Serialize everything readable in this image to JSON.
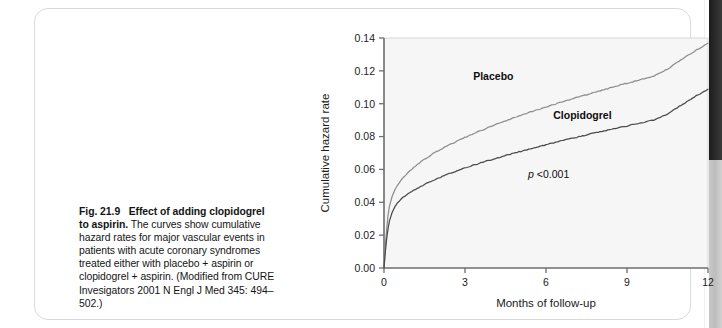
{
  "figure": {
    "caption": {
      "label": "Fig. 21.9",
      "title": "Effect of adding clopidogrel to aspirin.",
      "body": " The curves show cumulative hazard rates for major vascular events in patients with acute coronary syndromes treated either with placebo + aspirin or clopidogrel + aspirin. (Modified from CURE Invesigators 2001 N Engl J Med 345: 494–502.)"
    }
  },
  "chart_data": {
    "type": "line",
    "title": "",
    "xlabel": "Months of follow-up",
    "ylabel": "Cumulative hazard rate",
    "xlim": [
      0,
      12
    ],
    "ylim": [
      0.0,
      0.14
    ],
    "xticks": [
      0,
      3,
      6,
      9,
      12
    ],
    "xtick_labels": [
      "0",
      "3",
      "6",
      "9",
      "12"
    ],
    "yticks": [
      0.0,
      0.02,
      0.04,
      0.06,
      0.08,
      0.1,
      0.12,
      0.14
    ],
    "ytick_labels": [
      "0.00",
      "0.02",
      "0.04",
      "0.06",
      "0.08",
      "0.10",
      "0.12",
      "0.14"
    ],
    "grid": false,
    "legend_position": "inline-annotations",
    "annotations": [
      {
        "name": "p-value",
        "text_italic": "p",
        "text": " <0.001",
        "x": 6.1,
        "y": 0.055
      }
    ],
    "series": [
      {
        "name": "Placebo",
        "color": "#8d8d8d",
        "label_x": 4.05,
        "label_y": 0.1145,
        "x": [
          0,
          0.05,
          0.1,
          0.15,
          0.2,
          0.3,
          0.4,
          0.5,
          0.7,
          0.9,
          1.1,
          1.3,
          1.5,
          1.8,
          2.1,
          2.4,
          2.7,
          3.0,
          3.4,
          3.8,
          4.2,
          4.6,
          5.0,
          5.5,
          6.0,
          6.5,
          7.0,
          7.5,
          8.0,
          8.5,
          9.0,
          9.5,
          10.0,
          10.5,
          11.0,
          11.5,
          12.0
        ],
        "y": [
          0.0,
          0.013,
          0.024,
          0.032,
          0.0375,
          0.0435,
          0.0475,
          0.0505,
          0.0548,
          0.0582,
          0.0612,
          0.0638,
          0.0662,
          0.0694,
          0.0722,
          0.0748,
          0.0772,
          0.0795,
          0.0824,
          0.0851,
          0.0877,
          0.0901,
          0.0925,
          0.0953,
          0.098,
          0.1006,
          0.1031,
          0.1055,
          0.1079,
          0.1102,
          0.1124,
          0.1146,
          0.1168,
          0.1211,
          0.1266,
          0.132,
          0.1368
        ]
      },
      {
        "name": "Clopidogrel",
        "color": "#4a4a4a",
        "label_x": 7.35,
        "label_y": 0.0905,
        "x": [
          0,
          0.05,
          0.1,
          0.15,
          0.2,
          0.3,
          0.4,
          0.5,
          0.7,
          0.9,
          1.1,
          1.3,
          1.5,
          1.8,
          2.1,
          2.4,
          2.7,
          3.0,
          3.4,
          3.8,
          4.2,
          4.6,
          5.0,
          5.5,
          6.0,
          6.5,
          7.0,
          7.5,
          8.0,
          8.5,
          9.0,
          9.5,
          10.0,
          10.5,
          11.0,
          11.5,
          12.0
        ],
        "y": [
          0.0,
          0.01,
          0.018,
          0.024,
          0.0285,
          0.0338,
          0.0372,
          0.0396,
          0.0428,
          0.0452,
          0.0473,
          0.0492,
          0.0509,
          0.0532,
          0.0553,
          0.0573,
          0.0591,
          0.0608,
          0.063,
          0.0651,
          0.067,
          0.0689,
          0.0707,
          0.0729,
          0.075,
          0.0771,
          0.0791,
          0.081,
          0.0829,
          0.0847,
          0.0865,
          0.0883,
          0.0901,
          0.0938,
          0.099,
          0.1042,
          0.1088
        ]
      }
    ]
  }
}
